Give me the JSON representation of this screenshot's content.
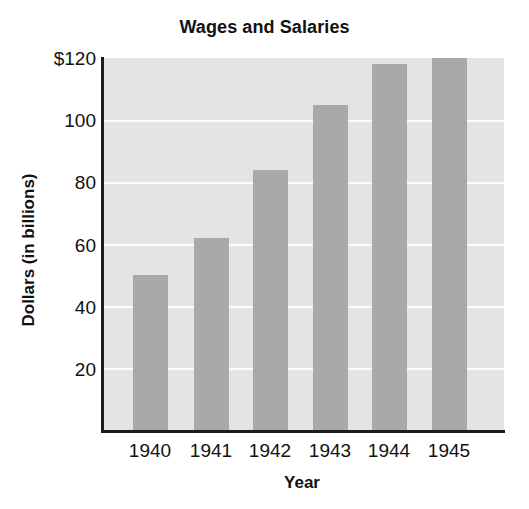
{
  "chart_data": {
    "type": "bar",
    "title": "Wages and Salaries",
    "xlabel": "Year",
    "ylabel": "Dollars (in billions)",
    "categories": [
      "1940",
      "1941",
      "1942",
      "1943",
      "1944",
      "1945"
    ],
    "values": [
      50,
      62,
      84,
      105,
      118,
      120
    ],
    "ylim": [
      0,
      120
    ],
    "yticks": [
      20,
      40,
      60,
      80,
      100,
      120
    ],
    "ytick_labels": [
      "20",
      "40",
      "60",
      "80",
      "100",
      "$120"
    ],
    "grid": true,
    "legend": "none",
    "series": [
      {
        "name": "Wages and Salaries",
        "values": [
          50,
          62,
          84,
          105,
          118,
          120
        ]
      }
    ],
    "colors": {
      "bar": "#a9a9a9",
      "plot_background": "#e4e4e4",
      "gridline": "#fbfbfb",
      "axis": "#1c1c1c",
      "text": "#111111",
      "figure_background": "#ffffff"
    }
  }
}
